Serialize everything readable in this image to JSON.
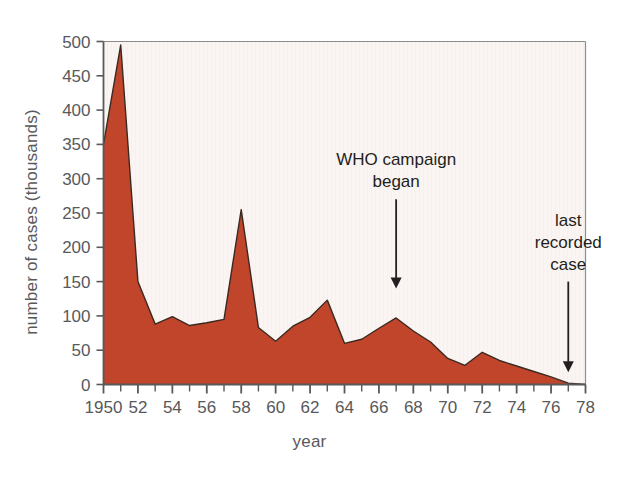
{
  "chart_data": {
    "type": "area",
    "title": "",
    "xlabel": "year",
    "ylabel": "number of cases (thousands)",
    "xlim": [
      1950,
      1978
    ],
    "ylim": [
      0,
      500
    ],
    "grid": false,
    "legend": "none",
    "series_color": "#c0452a",
    "plot_background": "#faf5f2",
    "axis_color": "#58595b",
    "x": [
      1950,
      1951,
      1952,
      1953,
      1954,
      1955,
      1956,
      1957,
      1958,
      1959,
      1960,
      1961,
      1962,
      1963,
      1964,
      1965,
      1966,
      1967,
      1968,
      1969,
      1970,
      1971,
      1972,
      1973,
      1974,
      1975,
      1976,
      1977,
      1978
    ],
    "values": [
      350,
      495,
      150,
      88,
      99,
      86,
      90,
      95,
      255,
      83,
      63,
      85,
      98,
      123,
      60,
      66,
      82,
      97,
      78,
      62,
      38,
      28,
      47,
      35,
      27,
      19,
      11,
      2,
      0
    ],
    "x_tick_labels": [
      "1950",
      "52",
      "54",
      "56",
      "58",
      "60",
      "62",
      "64",
      "66",
      "68",
      "70",
      "72",
      "74",
      "76",
      "78"
    ],
    "x_tick_values": [
      1950,
      1952,
      1954,
      1956,
      1958,
      1960,
      1962,
      1964,
      1966,
      1968,
      1970,
      1972,
      1974,
      1976,
      1978
    ],
    "x_minor_interval": 1,
    "y_tick_labels": [
      "0",
      "50",
      "100",
      "150",
      "200",
      "250",
      "300",
      "350",
      "400",
      "450",
      "500"
    ],
    "y_tick_values": [
      0,
      50,
      100,
      150,
      200,
      250,
      300,
      350,
      400,
      450,
      500
    ],
    "annotations": [
      {
        "id": "who-campaign",
        "lines": [
          "WHO campaign",
          "began"
        ],
        "pointer_x_year": 1967,
        "pointer_from_value": 270,
        "pointer_to_value": 140
      },
      {
        "id": "last-recorded-case",
        "lines": [
          "last",
          "recorded",
          "case"
        ],
        "pointer_x_year": 1977,
        "pointer_from_value": 150,
        "pointer_to_value": 18
      }
    ]
  }
}
